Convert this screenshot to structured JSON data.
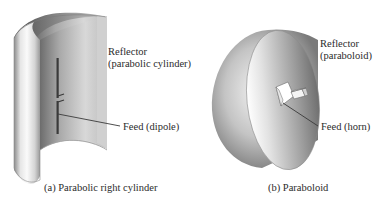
{
  "figure": {
    "panel_a": {
      "caption": "(a) Parabolic right cylinder",
      "reflector_label_line1": "Reflector",
      "reflector_label_line2": "(parabolic cylinder)",
      "feed_label": "Feed (dipole)",
      "reflector_shape": "parabolic-cylinder",
      "feed_shape": "dipole"
    },
    "panel_b": {
      "caption": "(b) Paraboloid",
      "reflector_label_line1": "Reflector",
      "reflector_label_line2": "(paraboloid)",
      "feed_label": "Feed (horn)",
      "reflector_shape": "paraboloid",
      "feed_shape": "horn"
    },
    "colors": {
      "background": "#ffffff",
      "text": "#2b2b2b",
      "surface_light": "#f2f2f2",
      "surface_mid": "#b8b8b8",
      "surface_dark": "#6e6e6e",
      "leader_line": "#3a3a3a"
    }
  }
}
